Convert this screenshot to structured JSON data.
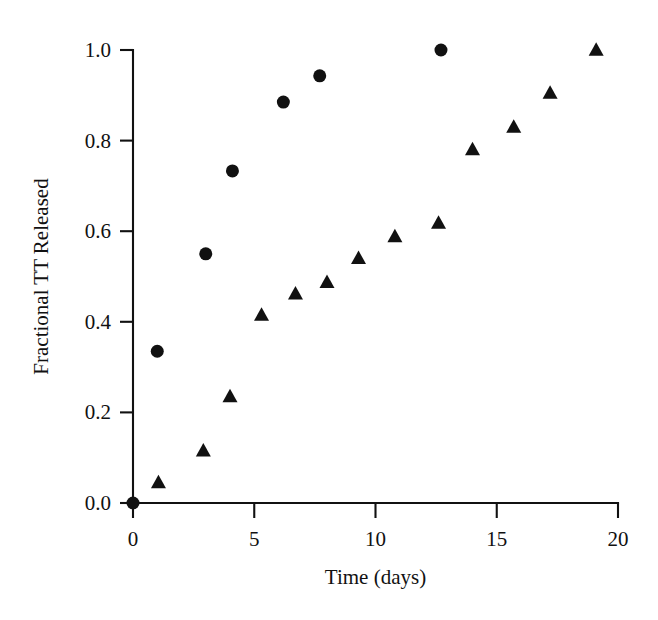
{
  "figure": {
    "background_color": "#ffffff",
    "marker_color": "#111111",
    "axis_color": "#111111",
    "width": 658,
    "height": 620
  },
  "chart_data": {
    "type": "scatter",
    "title": "",
    "subtitle": "",
    "xlabel": "Time (days)",
    "ylabel": "Fractional TT Released",
    "xlim": [
      0,
      20
    ],
    "ylim": [
      0.0,
      1.0
    ],
    "xticks": [
      0,
      5,
      10,
      15,
      20
    ],
    "xtick_labels": [
      "0",
      "5",
      "10",
      "15",
      "20"
    ],
    "yticks": [
      0.0,
      0.2,
      0.4,
      0.6,
      0.8,
      1.0
    ],
    "ytick_labels": [
      "0.0",
      "0.2",
      "0.4",
      "0.6",
      "0.8",
      "1.0"
    ],
    "grid": false,
    "legend": false,
    "legend_position": "none",
    "series": [
      {
        "name": "circles",
        "marker": "circle",
        "color": "#111111",
        "marker_size": 13,
        "x": [
          0.0,
          1.0,
          3.0,
          4.1,
          6.2,
          7.7,
          12.7
        ],
        "y": [
          0.0,
          0.335,
          0.55,
          0.733,
          0.885,
          0.943,
          1.0
        ]
      },
      {
        "name": "triangles",
        "marker": "triangle",
        "color": "#111111",
        "marker_size": 15,
        "x": [
          1.05,
          2.9,
          4.0,
          5.3,
          6.7,
          8.0,
          9.3,
          10.8,
          12.6,
          14.0,
          15.7,
          17.2,
          19.1
        ],
        "y": [
          0.045,
          0.115,
          0.235,
          0.415,
          0.462,
          0.487,
          0.54,
          0.588,
          0.618,
          0.78,
          0.83,
          0.905,
          1.0
        ]
      }
    ]
  }
}
